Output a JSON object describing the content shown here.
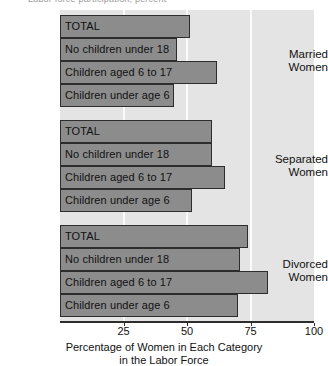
{
  "top_caption": "Labor force participation, percent",
  "chart_data": {
    "type": "bar",
    "orientation": "horizontal",
    "title": "",
    "xlabel": "Percentage of Women in Each Category in the Labor Force",
    "xlabel_line1": "Percentage of Women in Each Category",
    "xlabel_line2": "in the Labor Force",
    "ylabel": "",
    "xlim": [
      0,
      100
    ],
    "xticks": [
      25,
      50,
      75,
      100
    ],
    "xtick_labels": [
      "25",
      "50",
      "75",
      "100"
    ],
    "grid": "vertical-white-at-ticks",
    "legend": "none",
    "bar_color": "#8c8c8c",
    "bar_edge_color": "#2d2d2d",
    "plot_background": "#e4e4e4",
    "categories": [
      "TOTAL",
      "No children under 18",
      "Children aged 6 to 17",
      "Children under age 6"
    ],
    "groups": [
      {
        "name": "Married Women",
        "label_line1": "Married",
        "label_line2": "Women",
        "bars": [
          {
            "label": "TOTAL",
            "value": 51
          },
          {
            "label": "No children under 18",
            "value": 46
          },
          {
            "label": "Children aged 6 to 17",
            "value": 62
          },
          {
            "label": "Children under age 6",
            "value": 45
          }
        ]
      },
      {
        "name": "Separated Women",
        "label_line1": "Separated",
        "label_line2": "Women",
        "bars": [
          {
            "label": "TOTAL",
            "value": 60
          },
          {
            "label": "No children under 18",
            "value": 60
          },
          {
            "label": "Children aged 6 to 17",
            "value": 65
          },
          {
            "label": "Children under age 6",
            "value": 52
          }
        ]
      },
      {
        "name": "Divorced Women",
        "label_line1": "Divorced",
        "label_line2": "Women",
        "bars": [
          {
            "label": "TOTAL",
            "value": 74
          },
          {
            "label": "No children under 18",
            "value": 71
          },
          {
            "label": "Children aged 6 to 17",
            "value": 82
          },
          {
            "label": "Children under age 6",
            "value": 70
          }
        ]
      }
    ]
  }
}
